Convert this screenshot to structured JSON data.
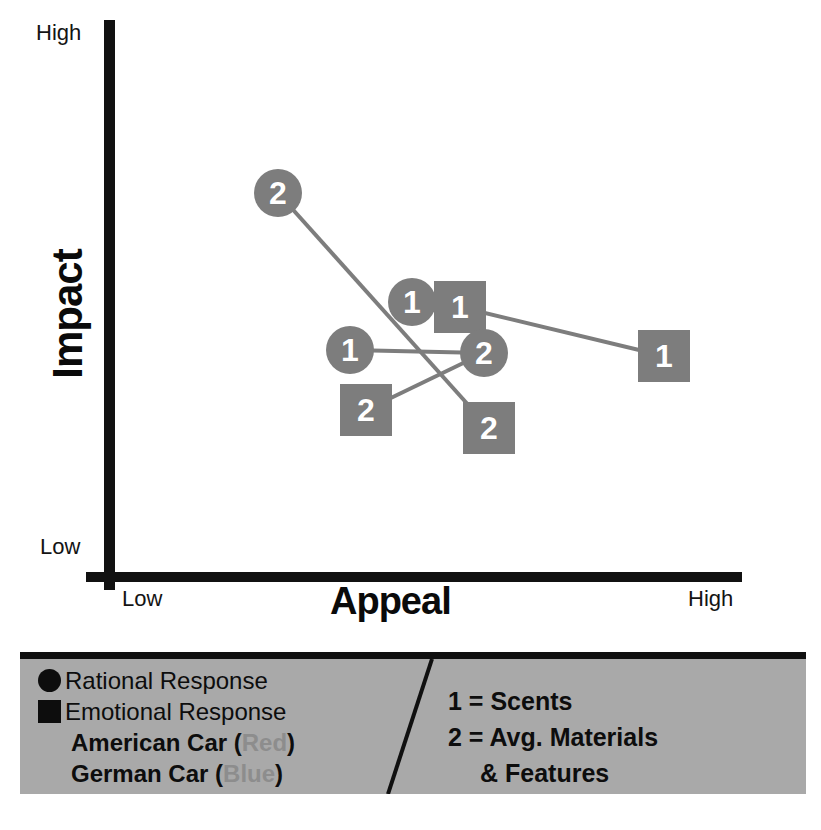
{
  "chart_data": {
    "type": "scatter",
    "title": "",
    "xlabel": "Appeal",
    "ylabel": "Impact",
    "x_ticks": [
      "Low",
      "High"
    ],
    "y_ticks": [
      "Low",
      "High"
    ],
    "xlim": [
      "Low",
      "High"
    ],
    "ylim": [
      "Low",
      "High"
    ],
    "grid": false,
    "legend_position": "bottom",
    "marker_color": "#7d7d7d",
    "axis_color": "#111111",
    "legend_background": "#a9a9a9",
    "series": [
      {
        "name": "American Car (Red)",
        "note": "rendered in gray in this reproduction",
        "points": [
          {
            "id": "am-rational-1",
            "label": "1",
            "shape": "circle",
            "x_px": 412,
            "y_px": 302,
            "attribute": "Scents",
            "response": "Rational Response"
          },
          {
            "id": "am-emotional-1",
            "label": "1",
            "shape": "square",
            "x_px": 460,
            "y_px": 307,
            "attribute": "Scents",
            "response": "Emotional Response"
          },
          {
            "id": "am-rational-2",
            "label": "2",
            "shape": "circle",
            "x_px": 278,
            "y_px": 193,
            "attribute": "Avg. Materials & Features",
            "response": "Rational Response"
          },
          {
            "id": "am-emotional-2",
            "label": "2",
            "shape": "square",
            "x_px": 489,
            "y_px": 428,
            "attribute": "Avg. Materials & Features",
            "response": "Emotional Response"
          }
        ]
      },
      {
        "name": "German Car (Blue)",
        "note": "rendered in gray in this reproduction",
        "points": [
          {
            "id": "ge-rational-1",
            "label": "1",
            "shape": "circle",
            "x_px": 350,
            "y_px": 350,
            "attribute": "Scents",
            "response": "Rational Response"
          },
          {
            "id": "ge-emotional-1",
            "label": "1",
            "shape": "square",
            "x_px": 664,
            "y_px": 356,
            "attribute": "Scents",
            "response": "Emotional Response"
          },
          {
            "id": "ge-rational-2",
            "label": "2",
            "shape": "circle",
            "x_px": 484,
            "y_px": 353,
            "attribute": "Avg. Materials & Features",
            "response": "Rational Response"
          },
          {
            "id": "ge-emotional-2",
            "label": "2",
            "shape": "square",
            "x_px": 366,
            "y_px": 410,
            "attribute": "Avg. Materials & Features",
            "response": "Emotional Response"
          }
        ]
      }
    ],
    "connectors": [
      {
        "from": "am-rational-2",
        "to": "am-emotional-2"
      },
      {
        "from": "ge-rational-1",
        "to": "ge-rational-2"
      },
      {
        "from": "ge-emotional-2",
        "to": "ge-rational-2"
      },
      {
        "from": "am-emotional-1",
        "to": "ge-emotional-1"
      }
    ]
  },
  "axes": {
    "y_title": "Impact",
    "y_high": "High",
    "y_low": "Low",
    "x_title": "Appeal",
    "x_low": "Low",
    "x_high": "High"
  },
  "legend": {
    "left": [
      {
        "swatch": "circle",
        "text": "Rational Response"
      },
      {
        "swatch": "square",
        "text": "Emotional Response"
      },
      {
        "swatch": "none",
        "text": "American Car (",
        "muted": "Red",
        "tail": ")"
      },
      {
        "swatch": "none",
        "text": "German Car (",
        "muted": "Blue",
        "tail": ")"
      }
    ],
    "right": [
      "1 = Scents",
      "2 = Avg. Materials",
      "& Features"
    ]
  }
}
